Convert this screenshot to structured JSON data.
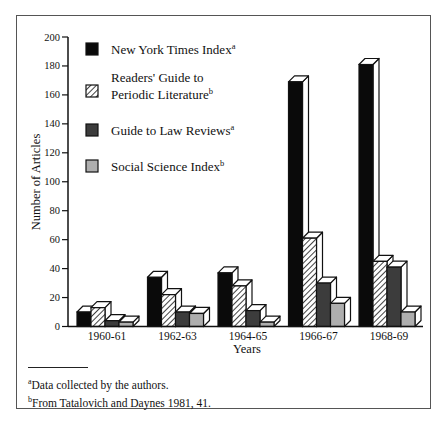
{
  "chart_data": {
    "type": "bar",
    "style": "3d-grouped",
    "title": "",
    "xlabel": "Years",
    "ylabel": "Number of Articles",
    "ylim": [
      0,
      200
    ],
    "yticks": [
      0,
      20,
      40,
      60,
      80,
      100,
      120,
      140,
      160,
      180,
      200
    ],
    "grid": false,
    "legend_position": "upper-left-inside",
    "categories": [
      "1960-61",
      "1962-63",
      "1964-65",
      "1966-67",
      "1968-69"
    ],
    "series": [
      {
        "name": "New York Times Index",
        "footnote_mark": "a",
        "fill": "solid-black",
        "color": "#0a0a0a",
        "values": [
          10,
          34,
          37,
          169,
          181
        ]
      },
      {
        "name": "Readers' Guide to Periodic Literature",
        "name_lines": [
          "Readers' Guide to",
          "Periodic Literature"
        ],
        "footnote_mark": "b",
        "fill": "diagonal-hatch",
        "color": "#ffffff",
        "values": [
          13,
          22,
          28,
          61,
          45
        ]
      },
      {
        "name": "Guide to Law Reviews",
        "footnote_mark": "a",
        "fill": "solid-dark-gray",
        "color": "#3c3c3c",
        "values": [
          4,
          10,
          11,
          30,
          41
        ]
      },
      {
        "name": "Social Science Index",
        "footnote_mark": "b",
        "fill": "solid-light-gray",
        "color": "#aeaeae",
        "values": [
          3,
          9,
          3,
          16,
          10
        ]
      }
    ]
  },
  "footnotes": [
    {
      "mark": "a",
      "text": "Data collected by the authors."
    },
    {
      "mark": "b",
      "text": "From Tatalovich and Daynes 1981, 41."
    }
  ]
}
